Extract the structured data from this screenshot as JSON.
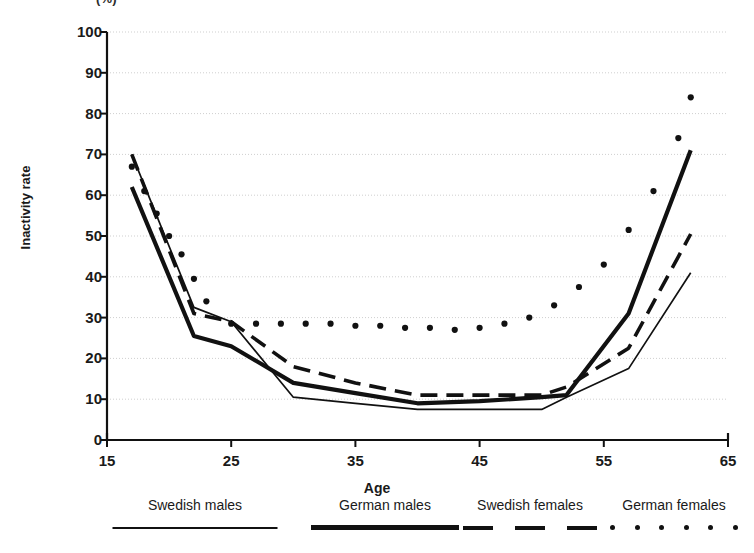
{
  "figure": {
    "title_clipped": "(%)",
    "xlabel": "Age",
    "ylabel": "Inactivity rate"
  },
  "axes": {
    "y_ticks": [
      "100",
      "90",
      "80",
      "70",
      "60",
      "50",
      "40",
      "30",
      "20",
      "10",
      "0"
    ],
    "x_ticks": [
      "15",
      "25",
      "35",
      "45",
      "55",
      "65"
    ]
  },
  "legend": {
    "items": [
      {
        "label": "Swedish males",
        "style": "thin-solid"
      },
      {
        "label": "German males",
        "style": "thick-solid"
      },
      {
        "label": "Swedish females",
        "style": "dashed"
      },
      {
        "label": "German females",
        "style": "dotted"
      }
    ]
  },
  "colors": {
    "line": "#111111",
    "grid": "#cfcfcf",
    "axis": "#111111",
    "background": "#ffffff"
  },
  "chart_data": {
    "type": "line",
    "title": "",
    "xlabel": "Age",
    "ylabel": "Inactivity rate",
    "xlim": [
      15,
      65
    ],
    "ylim": [
      0,
      100
    ],
    "xticks": [
      15,
      25,
      35,
      45,
      55,
      65
    ],
    "yticks": [
      0,
      10,
      20,
      30,
      40,
      50,
      60,
      70,
      80,
      90,
      100
    ],
    "grid": "horizontal-dotted",
    "legend_position": "below-plot",
    "series": [
      {
        "name": "Swedish males",
        "style": "thin-solid",
        "x": [
          17,
          22,
          25,
          30,
          35,
          40,
          45,
          50,
          52,
          57,
          62
        ],
        "y": [
          70,
          32.5,
          29,
          10.5,
          9,
          7.5,
          7.5,
          7.5,
          10.5,
          17.5,
          41
        ]
      },
      {
        "name": "German males",
        "style": "thick-solid",
        "x": [
          17,
          22,
          25,
          30,
          35,
          40,
          45,
          50,
          52,
          57,
          62
        ],
        "y": [
          62,
          25.5,
          23,
          14,
          11.5,
          9,
          9.5,
          10.5,
          11,
          31,
          71
        ]
      },
      {
        "name": "Swedish females",
        "style": "dashed",
        "x": [
          17,
          22,
          25,
          30,
          35,
          40,
          45,
          50,
          52,
          57,
          62
        ],
        "y": [
          70,
          31,
          29,
          18,
          14,
          11,
          11,
          11,
          13,
          22.5,
          50.5
        ]
      },
      {
        "name": "German females",
        "style": "dotted",
        "x": [
          17,
          18,
          19,
          20,
          21,
          22,
          23,
          25,
          27,
          29,
          31,
          33,
          35,
          37,
          39,
          41,
          43,
          45,
          47,
          49,
          51,
          53,
          55,
          57,
          59,
          61,
          62
        ],
        "y": [
          67,
          61,
          55.5,
          50,
          45.5,
          39.5,
          34,
          28.5,
          28.5,
          28.5,
          28.5,
          28.5,
          28,
          28,
          27.5,
          27.5,
          27,
          27.5,
          28.5,
          30,
          33,
          37.5,
          43,
          51.5,
          61,
          74,
          84
        ]
      }
    ],
    "annotations": [
      {
        "text": "German females rate ends at 90 at the oldest plotted point",
        "value": 90
      }
    ]
  }
}
